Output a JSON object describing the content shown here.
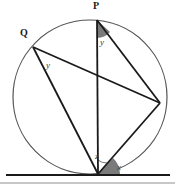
{
  "figure": {
    "background_color": "#ffffff",
    "stroke_color": "#1a1a1a",
    "circle_stroke_color": "#555555",
    "angle_fill_color": "#7a7a7a",
    "baseline_color": "#1a1a1a",
    "footer_band_color": "#b5b5b5"
  },
  "circle": {
    "center_x": 90,
    "center_y": 97,
    "radius": 77,
    "stroke_width": 1.2
  },
  "points": [
    {
      "id": "P",
      "label": "P",
      "x": 97,
      "y": 20,
      "description": "top point on circle"
    },
    {
      "id": "Q",
      "label": "Q",
      "x": 33,
      "y": 47,
      "description": "upper left point on circle"
    },
    {
      "id": "R",
      "label": "",
      "x": 160,
      "y": 103,
      "description": "right point on circle"
    },
    {
      "id": "S",
      "label": "",
      "x": 98,
      "y": 174,
      "description": "bottom tangent point on circle"
    }
  ],
  "chords": [
    {
      "name": "chord-P-S",
      "from": "P",
      "to": "S"
    },
    {
      "name": "chord-P-R",
      "from": "P",
      "to": "R"
    },
    {
      "name": "chord-Q-R",
      "from": "Q",
      "to": "R"
    },
    {
      "name": "chord-Q-S",
      "from": "Q",
      "to": "S"
    },
    {
      "name": "chord-R-S",
      "from": "R",
      "to": "S"
    }
  ],
  "tangent_line": {
    "name": "tangent-baseline",
    "x1": 6,
    "y1": 175,
    "x2": 170,
    "y2": 175
  },
  "footer_band": {
    "x1": 0,
    "y1": 183,
    "x2": 175,
    "y2": 183
  },
  "angles": [
    {
      "id": "angle-y-at-P",
      "label": "y",
      "vertex": "P",
      "between": [
        "P-S",
        "P-R"
      ],
      "shaded": true,
      "label_x": 100,
      "label_y": 38
    },
    {
      "id": "angle-y-at-Q",
      "label": "y",
      "vertex": "Q",
      "between": [
        "Q-R",
        "Q-S"
      ],
      "shaded": false,
      "label_x": 46,
      "label_y": 61
    },
    {
      "id": "angle-z-at-S",
      "label": "z",
      "vertex": "S",
      "between": [
        "S-P",
        "S-R"
      ],
      "shaded": false,
      "label_x": 95,
      "label_y": 152
    },
    {
      "id": "angle-x-at-S",
      "label": "x",
      "vertex": "S",
      "between": [
        "S-R",
        "tangent-right"
      ],
      "shaded": true,
      "label_x": 117,
      "label_y": 163
    }
  ]
}
